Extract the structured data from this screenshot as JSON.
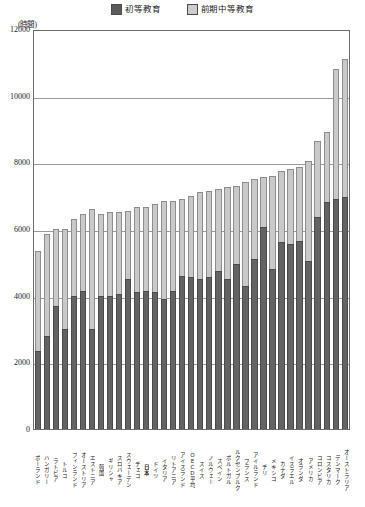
{
  "chart_data": {
    "type": "bar",
    "stacked": true,
    "title": "",
    "xlabel": "",
    "ylabel": "(時間)",
    "ylim": [
      0,
      12000
    ],
    "yticks": [
      0,
      2000,
      4000,
      6000,
      8000,
      10000,
      12000
    ],
    "grid": true,
    "legend_position": "top-center",
    "legend": [
      "初等教育",
      "前期中等教育"
    ],
    "highlight_category": "日本",
    "categories": [
      "ポーランド",
      "ハンガリー",
      "ラトビア",
      "トルコ",
      "フィンランド",
      "オーストリア",
      "エストニア",
      "韓国",
      "ギリシャ",
      "スロバキア",
      "スウェーデン",
      "チェコ",
      "日本",
      "ドイツ",
      "イタリア",
      "リトアニア",
      "アイスランド",
      "OECD平均",
      "スイス",
      "ノルウェー",
      "スペイン",
      "ポルトガル",
      "ルクセンブルク",
      "フランス",
      "アイルランド",
      "チリ",
      "メキシコ",
      "カナダ",
      "イスラエル",
      "オランダ",
      "アメリカ",
      "コロンビア",
      "コスタリカ",
      "デンマーク",
      "オーストラリア"
    ],
    "series": [
      {
        "name": "初等教育",
        "color": "#636363",
        "values": [
          2350,
          2800,
          3700,
          3000,
          4000,
          4150,
          3000,
          4000,
          4000,
          4050,
          4500,
          4100,
          4150,
          4100,
          3900,
          4150,
          4600,
          4550,
          4500,
          4550,
          4750,
          4500,
          4950,
          4300,
          5100,
          6050,
          4800,
          5600,
          5550,
          5650,
          5050,
          6350,
          6800,
          6900,
          6950
        ]
      },
      {
        "name": "前期中等教育",
        "color": "#c9c9c9",
        "values": [
          3000,
          3050,
          2300,
          3000,
          2300,
          2300,
          3600,
          2450,
          2500,
          2450,
          2050,
          2550,
          2500,
          2650,
          2950,
          2700,
          2300,
          2450,
          2600,
          2600,
          2450,
          2750,
          2350,
          3100,
          2400,
          1500,
          2800,
          2150,
          2250,
          2200,
          3000,
          2300,
          2100,
          3900,
          4150
        ]
      }
    ],
    "totals": [
      5350,
      5850,
      6000,
      6000,
      6300,
      6450,
      6600,
      6450,
      6500,
      6500,
      6550,
      6650,
      6650,
      6750,
      6850,
      6850,
      6900,
      7000,
      7100,
      7150,
      7200,
      7250,
      7300,
      7400,
      7500,
      7550,
      7600,
      7750,
      7800,
      7850,
      8050,
      8650,
      8900,
      10800,
      11100
    ]
  }
}
